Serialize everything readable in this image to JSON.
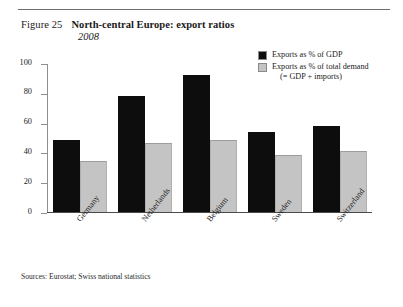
{
  "figure": {
    "number": "Figure 25",
    "title": "North-central Europe: export ratios",
    "subtitle": "2008",
    "sources": "Sources: Eurostat; Swiss national statistics"
  },
  "legend": {
    "position": "top-right",
    "items": [
      {
        "label": "Exports as % of GDP",
        "sublabel": "",
        "color": "#0d0d0d",
        "swatch_name": "legend-swatch-gdp"
      },
      {
        "label": "Exports as % of total demand",
        "sublabel": "(= GDP + imports)",
        "color": "#c4c4c4",
        "swatch_name": "legend-swatch-total-demand"
      }
    ]
  },
  "axis": {
    "y_ticks": [
      "100",
      "80",
      "60",
      "40",
      "20",
      "0"
    ]
  },
  "chart_data": {
    "type": "bar",
    "title": "North-central Europe: export ratios",
    "subtitle": "2008",
    "xlabel": "",
    "ylabel": "",
    "ylim": [
      0,
      100
    ],
    "yticks": [
      0,
      20,
      40,
      60,
      80,
      100
    ],
    "grid": false,
    "legend_position": "top-right",
    "categories": [
      "Germany",
      "Netherlands",
      "Belgium",
      "Sweden",
      "Switzerland"
    ],
    "series": [
      {
        "name": "Exports as % of GDP",
        "color": "#0d0d0d",
        "values": [
          48,
          78,
          92,
          54,
          58
        ]
      },
      {
        "name": "Exports as % of total demand (= GDP + imports)",
        "color": "#c4c4c4",
        "values": [
          34,
          46,
          48,
          38,
          41
        ]
      }
    ],
    "source": "Sources: Eurostat; Swiss national statistics"
  }
}
